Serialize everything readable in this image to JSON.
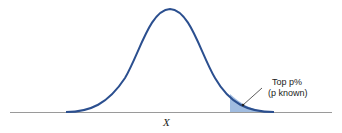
{
  "diagram": {
    "type": "normal-distribution-curve",
    "x_axis_label": "X",
    "annotation": {
      "line1": "Top p%",
      "line2": "(p known)"
    },
    "colors": {
      "curve": "#2b4f8f",
      "shaded_tail": "#8fb0da",
      "axis": "#9a9a9a",
      "leader": "#333333"
    }
  }
}
